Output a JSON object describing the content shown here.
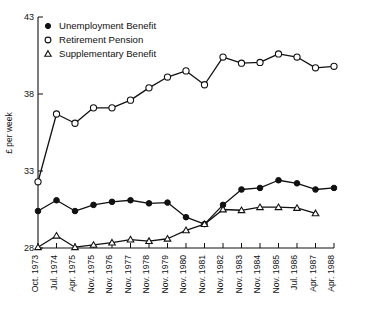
{
  "chart_data": {
    "type": "line",
    "title": "",
    "xlabel": "",
    "ylabel": "£ per week",
    "ylim": [
      28,
      43
    ],
    "yticks": [
      28,
      33,
      38,
      43
    ],
    "grid": false,
    "legend_position": "top-left",
    "categories": [
      "Oct. 1973",
      "Jul. 1974",
      "Apr. 1975",
      "Nov. 1975",
      "Nov. 1976",
      "Nov. 1977",
      "Nov. 1978",
      "Nov. 1979",
      "Nov. 1980",
      "Nov. 1981",
      "Nov. 1982",
      "Nov. 1983",
      "Nov. 1984",
      "Nov. 1985",
      "Jul. 1986",
      "Apr. 1987",
      "Apr. 1988"
    ],
    "series": [
      {
        "name": "Unemployment Benefit",
        "marker": "filled-circle",
        "values": [
          30.4,
          31.1,
          30.4,
          30.8,
          31.0,
          31.1,
          30.9,
          30.95,
          30.0,
          29.55,
          30.8,
          31.8,
          31.9,
          32.4,
          32.2,
          31.8,
          31.9
        ]
      },
      {
        "name": "Retirement Pension",
        "marker": "open-circle",
        "values": [
          32.3,
          36.7,
          36.1,
          37.1,
          37.1,
          37.6,
          38.4,
          39.1,
          39.5,
          38.6,
          40.4,
          40.0,
          40.05,
          40.6,
          40.4,
          39.7,
          39.8
        ]
      },
      {
        "name": "Supplementary Benefit",
        "marker": "open-triangle",
        "values": [
          28.05,
          28.8,
          28.05,
          28.2,
          28.35,
          28.55,
          28.45,
          28.6,
          29.15,
          29.55,
          30.5,
          30.45,
          30.65,
          30.65,
          30.6,
          30.25,
          null
        ]
      }
    ]
  },
  "legend": {
    "items": [
      {
        "label": "Unemployment Benefit",
        "marker": "filled-circle"
      },
      {
        "label": "Retirement Pension",
        "marker": "open-circle"
      },
      {
        "label": "Supplementary Benefit",
        "marker": "open-triangle"
      }
    ]
  },
  "axes": {
    "y_label": "£ per week",
    "y_tick_labels": [
      "43",
      "38",
      "33",
      "28"
    ]
  }
}
